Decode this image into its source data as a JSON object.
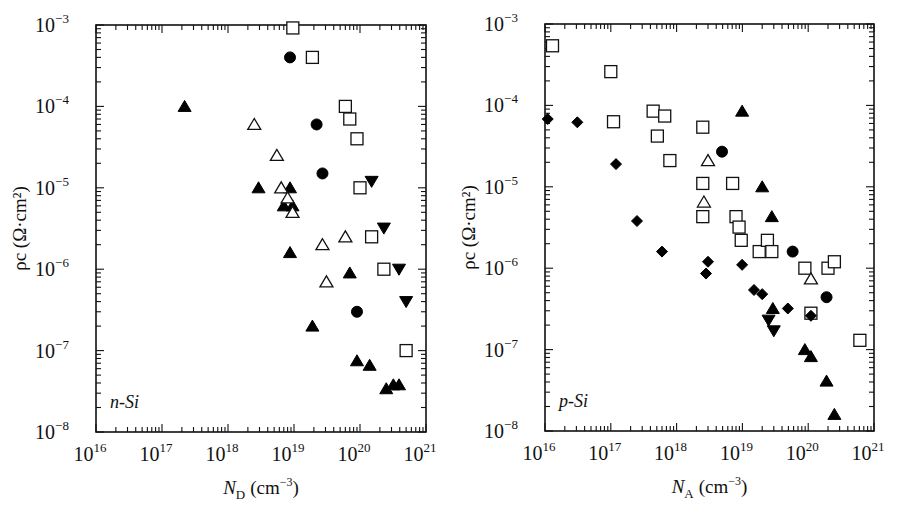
{
  "figure": {
    "panels": [
      "n-Si",
      "p-Si"
    ]
  },
  "chart_data": [
    {
      "type": "scatter",
      "title": "",
      "panel_label": "n-Si",
      "xlabel": "N_D (cm^-3)",
      "xlabel_main": "N",
      "xlabel_sub": "D",
      "xlabel_unit": "(cm",
      "xlabel_exp": "−3",
      "xlabel_close": ")",
      "ylabel": "ρc (Ω·cm²)",
      "xscale": "log",
      "yscale": "log",
      "xlim": [
        1e+16,
        1e+21
      ],
      "ylim": [
        1e-08,
        0.001
      ],
      "x_tick_labels": [
        {
          "base": "10",
          "exp": "16"
        },
        {
          "base": "10",
          "exp": "17"
        },
        {
          "base": "10",
          "exp": "18"
        },
        {
          "base": "10",
          "exp": "19"
        },
        {
          "base": "10",
          "exp": "20"
        },
        {
          "base": "10",
          "exp": "21"
        }
      ],
      "y_tick_labels": [
        {
          "base": "10",
          "exp": "−3"
        },
        {
          "base": "10",
          "exp": "−4"
        },
        {
          "base": "10",
          "exp": "−5"
        },
        {
          "base": "10",
          "exp": "−6"
        },
        {
          "base": "10",
          "exp": "−7"
        },
        {
          "base": "10",
          "exp": "−8"
        }
      ],
      "grid": false,
      "legend": null,
      "series": [
        {
          "name": "open-square",
          "marker": "square-open",
          "points": [
            [
              9.6e+18,
              0.00092
            ],
            [
              1.9e+19,
              0.0004
            ],
            [
              6e+19,
              0.0001
            ],
            [
              7e+19,
              7e-05
            ],
            [
              9e+19,
              4e-05
            ],
            [
              1e+20,
              1e-05
            ],
            [
              1.5e+20,
              2.5e-06
            ],
            [
              2.3e+20,
              1e-06
            ],
            [
              5e+20,
              1e-07
            ]
          ]
        },
        {
          "name": "filled-circle",
          "marker": "circle-filled",
          "points": [
            [
              8.7e+18,
              0.0004
            ],
            [
              2.2e+19,
              6e-05
            ],
            [
              2.7e+19,
              1.5e-05
            ],
            [
              9e+19,
              3e-07
            ]
          ]
        },
        {
          "name": "filled-triangle",
          "marker": "triangle-up-filled",
          "points": [
            [
              2.2e+17,
              0.0001
            ],
            [
              2.9e+18,
              1e-05
            ],
            [
              8.7e+18,
              1e-05
            ],
            [
              7e+18,
              6e-06
            ],
            [
              9.5e+18,
              6e-06
            ],
            [
              8.7e+18,
              1.6e-06
            ],
            [
              7e+19,
              9e-07
            ],
            [
              1.9e+19,
              2e-07
            ],
            [
              9e+19,
              7.5e-08
            ],
            [
              1.4e+20,
              6.6e-08
            ],
            [
              2.5e+20,
              3.4e-08
            ],
            [
              3.2e+20,
              3.8e-08
            ],
            [
              3.9e+20,
              3.8e-08
            ]
          ]
        },
        {
          "name": "open-triangle",
          "marker": "triangle-up-open",
          "points": [
            [
              2.5e+18,
              6e-05
            ],
            [
              5.5e+18,
              2.5e-05
            ],
            [
              6.4e+18,
              1e-05
            ],
            [
              8e+18,
              7.5e-06
            ],
            [
              9.5e+18,
              5e-06
            ],
            [
              2.7e+19,
              2e-06
            ],
            [
              6e+19,
              2.5e-06
            ],
            [
              3.1e+19,
              7e-07
            ]
          ]
        },
        {
          "name": "filled-inverted-triangle",
          "marker": "triangle-down-filled",
          "points": [
            [
              1.5e+20,
              1.2e-05
            ],
            [
              2.3e+20,
              3.2e-06
            ],
            [
              3.9e+20,
              1e-06
            ],
            [
              5e+20,
              4e-07
            ]
          ]
        }
      ]
    },
    {
      "type": "scatter",
      "title": "",
      "panel_label": "p-Si",
      "xlabel": "N_A (cm^-3)",
      "xlabel_main": "N",
      "xlabel_sub": "A",
      "xlabel_unit": "(cm",
      "xlabel_exp": "−3",
      "xlabel_close": ")",
      "ylabel": "ρc (Ω·cm²)",
      "xscale": "log",
      "yscale": "log",
      "xlim": [
        1e+16,
        1e+21
      ],
      "ylim": [
        1e-08,
        0.001
      ],
      "x_tick_labels": [
        {
          "base": "10",
          "exp": "16"
        },
        {
          "base": "10",
          "exp": "17"
        },
        {
          "base": "10",
          "exp": "18"
        },
        {
          "base": "10",
          "exp": "19"
        },
        {
          "base": "10",
          "exp": "20"
        },
        {
          "base": "10",
          "exp": "21"
        }
      ],
      "y_tick_labels": [
        {
          "base": "10",
          "exp": "−3"
        },
        {
          "base": "10",
          "exp": "−4"
        },
        {
          "base": "10",
          "exp": "−5"
        },
        {
          "base": "10",
          "exp": "−6"
        },
        {
          "base": "10",
          "exp": "−7"
        },
        {
          "base": "10",
          "exp": "−8"
        }
      ],
      "grid": false,
      "legend": null,
      "series": [
        {
          "name": "open-square",
          "marker": "square-open",
          "points": [
            [
              1.3e+16,
              0.00054
            ],
            [
              1e+17,
              0.00026
            ],
            [
              1.1e+17,
              6.3e-05
            ],
            [
              4.4e+17,
              8.5e-05
            ],
            [
              6.6e+17,
              7.4e-05
            ],
            [
              5.1e+17,
              4.2e-05
            ],
            [
              7.9e+17,
              2.1e-05
            ],
            [
              2.5e+18,
              5.4e-05
            ],
            [
              2.5e+18,
              1.1e-05
            ],
            [
              2.5e+18,
              4.3e-06
            ],
            [
              7.1e+18,
              1.1e-05
            ],
            [
              8e+18,
              4.3e-06
            ],
            [
              8.9e+18,
              3.2e-06
            ],
            [
              9.6e+18,
              2.2e-06
            ],
            [
              1.8e+19,
              1.6e-06
            ],
            [
              2.4e+19,
              2.2e-06
            ],
            [
              2.8e+19,
              1.6e-06
            ],
            [
              8.9e+19,
              1e-06
            ],
            [
              2e+20,
              1e-06
            ],
            [
              2.5e+20,
              1.2e-06
            ],
            [
              1.1e+20,
              2.8e-07
            ],
            [
              6.1e+20,
              1.3e-07
            ]
          ]
        },
        {
          "name": "filled-diamond",
          "marker": "diamond-filled",
          "points": [
            [
              1.1e+16,
              6.8e-05
            ],
            [
              3.1e+16,
              6.2e-05
            ],
            [
              1.2e+17,
              1.9e-05
            ],
            [
              2.5e+17,
              3.8e-06
            ],
            [
              6e+17,
              1.6e-06
            ],
            [
              3e+18,
              1.2e-06
            ],
            [
              2.8e+18,
              8.6e-07
            ],
            [
              9.9e+18,
              1.1e-06
            ],
            [
              1.5e+19,
              5.4e-07
            ],
            [
              2e+19,
              4.8e-07
            ],
            [
              4.9e+19,
              3.2e-07
            ],
            [
              1.1e+20,
              2.6e-07
            ]
          ]
        },
        {
          "name": "filled-circle",
          "marker": "circle-filled",
          "points": [
            [
              4.9e+18,
              2.7e-05
            ],
            [
              5.8e+19,
              1.6e-06
            ],
            [
              1.9e+20,
              4.4e-07
            ]
          ]
        },
        {
          "name": "filled-triangle",
          "marker": "triangle-up-filled",
          "points": [
            [
              9.9e+18,
              8.5e-05
            ],
            [
              2e+19,
              1e-05
            ],
            [
              2.8e+19,
              4.3e-06
            ],
            [
              2.9e+19,
              3.2e-07
            ],
            [
              8.9e+19,
              1e-07
            ],
            [
              1.1e+20,
              8.2e-08
            ],
            [
              1.9e+20,
              4.1e-08
            ],
            [
              2.5e+20,
              1.6e-08
            ]
          ]
        },
        {
          "name": "open-triangle",
          "marker": "triangle-up-open",
          "points": [
            [
              3e+18,
              2.1e-05
            ],
            [
              2.6e+18,
              6.5e-06
            ],
            [
              1.1e+20,
              7.4e-07
            ]
          ]
        },
        {
          "name": "filled-inverted-triangle",
          "marker": "triangle-down-filled",
          "points": [
            [
              2.5e+19,
              2.3e-07
            ],
            [
              3e+19,
              1.7e-07
            ]
          ]
        }
      ]
    }
  ],
  "layout": {
    "panels": [
      {
        "left": 96,
        "top": 25,
        "right": 426,
        "bottom": 432
      },
      {
        "left": 545,
        "top": 24,
        "right": 874,
        "bottom": 431
      }
    ]
  }
}
